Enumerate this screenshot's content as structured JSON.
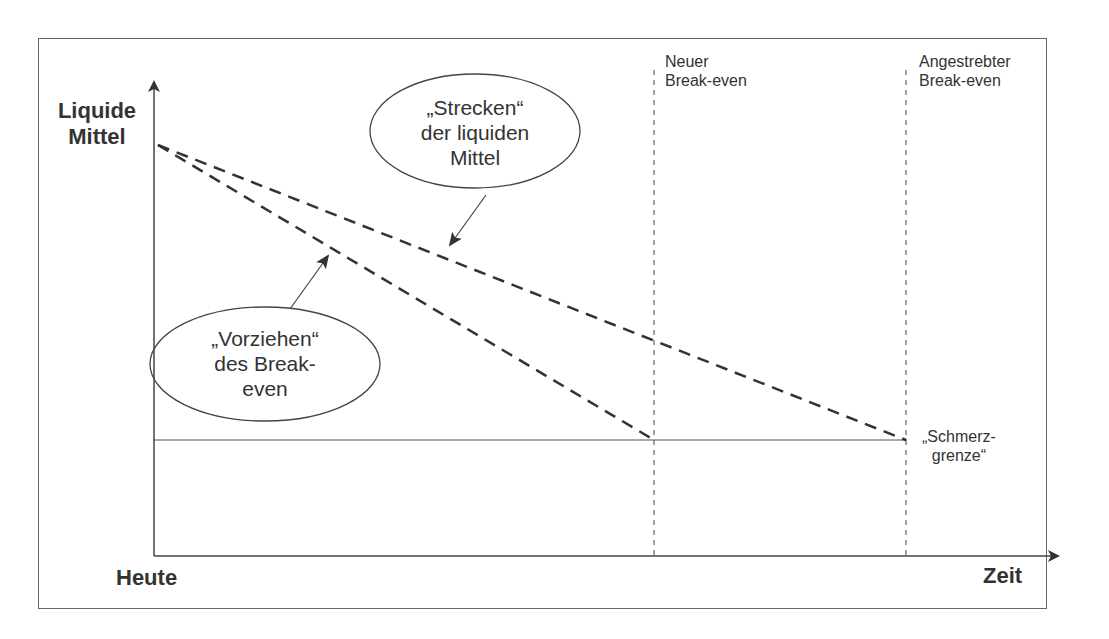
{
  "axes": {
    "y_label": "Liquide\nMittel",
    "y_label_line1": "Liquide",
    "y_label_line2": "Mittel",
    "x_start_label": "Heute",
    "x_end_label": "Zeit"
  },
  "vertical_markers": [
    {
      "line1": "Neuer",
      "line2": "Break-even"
    },
    {
      "line1": "Angestrebter",
      "line2": "Break-even"
    }
  ],
  "threshold": {
    "line1": "„Schmerz-",
    "line2": "grenze“"
  },
  "callouts": [
    {
      "line1": "„Strecken“",
      "line2": "der liquiden",
      "line3": "Mittel"
    },
    {
      "line1": "„Vorziehen“",
      "line2": "des Break-",
      "line3": "even"
    }
  ],
  "colors": {
    "line": "#333333",
    "frame": "#666666",
    "text": "#333333"
  }
}
